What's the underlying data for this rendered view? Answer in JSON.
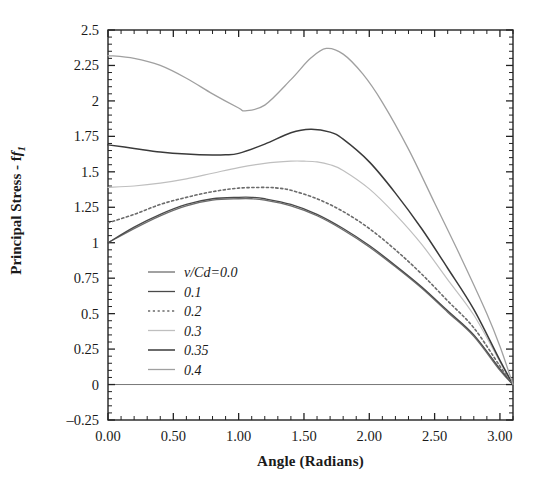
{
  "chart_data": {
    "type": "line",
    "title": "",
    "xlabel": "Angle (Radians)",
    "ylabel_text": "Principal Stress - f",
    "ylabel_sub": "1",
    "xlim": [
      0.0,
      3.1
    ],
    "ylim": [
      -0.25,
      2.5
    ],
    "xticks": [
      0.0,
      0.5,
      1.0,
      1.5,
      2.0,
      2.5,
      3.0
    ],
    "xticklabels": [
      "0.00",
      "0.50",
      "1.00",
      "1.50",
      "2.00",
      "2.50",
      "3.00"
    ],
    "yticks": [
      -0.25,
      0,
      0.25,
      0.5,
      0.75,
      1,
      1.25,
      1.5,
      1.75,
      2,
      2.25,
      2.5
    ],
    "yticklabels": [
      "-0.25",
      "0",
      "0.25",
      "0.5",
      "0.75",
      "1",
      "1.25",
      "1.5",
      "1.75",
      "2",
      "2.25",
      "2.5"
    ],
    "minor_ticks_per_interval": 5,
    "grid": false,
    "legend_position": "lower-left-inside",
    "legend_title_prefix": "v/Cd=",
    "series": [
      {
        "name": "v/Cd=0.0",
        "label": "v/Cd=0.0",
        "color": "#6e6e6e",
        "style": "solid",
        "width": 1.3,
        "x": [
          0.0,
          0.2,
          0.4,
          0.6,
          0.8,
          1.0,
          1.1,
          1.2,
          1.4,
          1.6,
          1.8,
          2.0,
          2.2,
          2.4,
          2.6,
          2.8,
          3.0,
          3.1
        ],
        "y": [
          1.0,
          1.1,
          1.19,
          1.26,
          1.3,
          1.31,
          1.31,
          1.3,
          1.26,
          1.19,
          1.09,
          0.97,
          0.83,
          0.68,
          0.51,
          0.34,
          0.1,
          0.0
        ]
      },
      {
        "name": "0.1",
        "label": "0.1",
        "color": "#4a4a4a",
        "style": "solid",
        "width": 1.3,
        "x": [
          0.0,
          0.2,
          0.4,
          0.6,
          0.8,
          1.0,
          1.1,
          1.2,
          1.4,
          1.6,
          1.8,
          2.0,
          2.2,
          2.4,
          2.6,
          2.8,
          3.0,
          3.1
        ],
        "y": [
          1.0,
          1.11,
          1.2,
          1.27,
          1.31,
          1.32,
          1.32,
          1.31,
          1.27,
          1.2,
          1.1,
          0.98,
          0.84,
          0.69,
          0.52,
          0.35,
          0.11,
          0.0
        ]
      },
      {
        "name": "0.2",
        "label": "0.2",
        "color": "#6b6b6b",
        "style": "dotted",
        "width": 1.6,
        "x": [
          0.0,
          0.2,
          0.4,
          0.6,
          0.8,
          1.0,
          1.2,
          1.3,
          1.4,
          1.6,
          1.8,
          2.0,
          2.2,
          2.4,
          2.6,
          2.8,
          3.0,
          3.1
        ],
        "y": [
          1.14,
          1.2,
          1.27,
          1.32,
          1.36,
          1.385,
          1.39,
          1.385,
          1.37,
          1.31,
          1.22,
          1.1,
          0.95,
          0.78,
          0.59,
          0.4,
          0.13,
          0.0
        ]
      },
      {
        "name": "0.3",
        "label": "0.3",
        "color": "#bfbfbf",
        "style": "solid",
        "width": 1.2,
        "x": [
          0.0,
          0.2,
          0.4,
          0.6,
          0.8,
          1.0,
          1.2,
          1.4,
          1.5,
          1.6,
          1.7,
          1.8,
          2.0,
          2.2,
          2.4,
          2.6,
          2.8,
          3.0,
          3.1
        ],
        "y": [
          1.39,
          1.4,
          1.42,
          1.45,
          1.49,
          1.53,
          1.56,
          1.575,
          1.575,
          1.57,
          1.55,
          1.51,
          1.38,
          1.2,
          0.99,
          0.74,
          0.49,
          0.16,
          0.0
        ]
      },
      {
        "name": "0.35",
        "label": "0.35",
        "color": "#3a3a3a",
        "style": "solid",
        "width": 1.5,
        "x": [
          0.0,
          0.2,
          0.4,
          0.6,
          0.8,
          0.9,
          1.0,
          1.2,
          1.4,
          1.55,
          1.7,
          1.8,
          2.0,
          2.2,
          2.4,
          2.6,
          2.8,
          3.0,
          3.1
        ],
        "y": [
          1.69,
          1.665,
          1.64,
          1.625,
          1.618,
          1.62,
          1.63,
          1.695,
          1.775,
          1.8,
          1.78,
          1.73,
          1.57,
          1.35,
          1.1,
          0.82,
          0.53,
          0.17,
          0.0
        ]
      },
      {
        "name": "0.4",
        "label": "0.4",
        "color": "#a0a0a0",
        "style": "solid",
        "width": 1.3,
        "x": [
          0.0,
          0.2,
          0.4,
          0.6,
          0.8,
          1.0,
          1.05,
          1.2,
          1.4,
          1.55,
          1.67,
          1.8,
          1.95,
          2.1,
          2.3,
          2.5,
          2.7,
          2.9,
          3.0,
          3.1
        ],
        "y": [
          2.32,
          2.3,
          2.25,
          2.16,
          2.05,
          1.95,
          1.93,
          1.97,
          2.15,
          2.3,
          2.37,
          2.33,
          2.19,
          1.99,
          1.66,
          1.28,
          0.9,
          0.5,
          0.27,
          0.0
        ]
      }
    ]
  },
  "legend": {
    "entries": [
      {
        "label": "v/Cd=0.0"
      },
      {
        "label": "0.1"
      },
      {
        "label": "0.2"
      },
      {
        "label": "0.3"
      },
      {
        "label": "0.35"
      },
      {
        "label": "0.4"
      }
    ]
  },
  "axes": {
    "frame_color": "#222222",
    "zero_line_color": "#777777"
  }
}
